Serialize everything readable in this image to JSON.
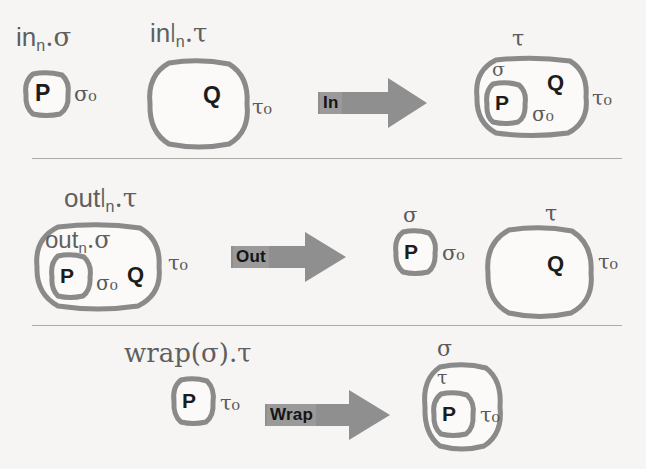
{
  "figure": {
    "background_color": "#f6f5f3",
    "ink_color": "#8a8a8a",
    "text_color": "#5a5a5a",
    "arrow_color": "#8f8f8f",
    "arrow_badge_color": "#9a9a9a"
  },
  "rows": [
    {
      "id": "in-rule",
      "arrow": {
        "label": "In"
      },
      "lhs": {
        "term_p": {
          "head": "in",
          "sub": "n",
          "tail": ".σ"
        },
        "term_q": {
          "head": "in",
          "sup": "|",
          "sub": "n",
          "tail": ".τ"
        },
        "p_letter": "P",
        "p_ann": "σ₀",
        "q_letter": "Q",
        "q_ann": "τ₀"
      },
      "rhs": {
        "outer_ann": "τ",
        "outer_ann_right": "τ₀",
        "inner_ann": "σ",
        "inner_ann_right": "σ₀",
        "p_letter": "P",
        "q_letter": "Q"
      }
    },
    {
      "id": "out-rule",
      "arrow": {
        "label": "Out"
      },
      "lhs": {
        "term_outer": {
          "head": "out",
          "sup": "|",
          "sub": "n",
          "tail": ".τ"
        },
        "term_inner": {
          "head": "out",
          "sub": "n",
          "tail": ".σ"
        },
        "p_letter": "P",
        "p_ann": "σ₀",
        "q_letter": "Q",
        "outer_ann_right": "τ₀"
      },
      "rhs": {
        "p_ann_top": "σ",
        "p_letter": "P",
        "p_ann_right": "σ₀",
        "q_ann_top": "τ",
        "q_letter": "Q",
        "q_ann_right": "τ₀"
      }
    },
    {
      "id": "wrap-rule",
      "arrow": {
        "label": "Wrap"
      },
      "lhs": {
        "term": {
          "head": "wrap(σ)",
          "tail": ".τ"
        },
        "p_letter": "P",
        "p_ann": "τ₀"
      },
      "rhs": {
        "outer_ann": "σ",
        "inner_ann": "τ",
        "p_letter": "P",
        "p_ann": "τ₀"
      }
    }
  ]
}
